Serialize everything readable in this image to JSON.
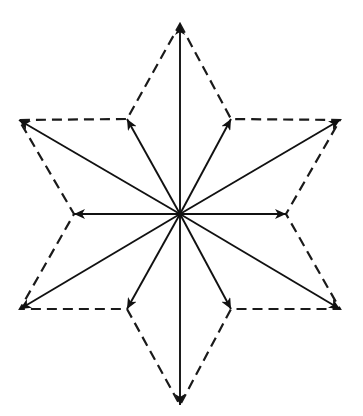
{
  "diagram": {
    "title": "",
    "type": "vector star diagram",
    "center": [
      180,
      214
    ],
    "colors": {
      "stroke": "#111111",
      "background": "#ffffff"
    },
    "outline_style": "dashed",
    "outer_vertices": [
      {
        "name": "top",
        "point": [
          180,
          24
        ]
      },
      {
        "name": "upper-right",
        "point": [
          340,
          120
        ]
      },
      {
        "name": "lower-right",
        "point": [
          340,
          309
        ]
      },
      {
        "name": "bottom",
        "point": [
          180,
          405
        ]
      },
      {
        "name": "lower-left",
        "point": [
          20,
          309
        ]
      },
      {
        "name": "upper-left",
        "point": [
          19,
          120
        ]
      }
    ],
    "inner_vertices": [
      {
        "name": "inner-upper-right",
        "point": [
          231,
          119
        ]
      },
      {
        "name": "inner-right",
        "point": [
          286,
          214
        ]
      },
      {
        "name": "inner-lower-right",
        "point": [
          231,
          309
        ]
      },
      {
        "name": "inner-lower-left",
        "point": [
          127,
          309
        ]
      },
      {
        "name": "inner-left",
        "point": [
          74,
          214
        ]
      },
      {
        "name": "inner-upper-left",
        "point": [
          127,
          119
        ]
      }
    ],
    "outline_order": [
      "top",
      "inner-upper-right",
      "upper-right",
      "inner-right",
      "lower-right",
      "inner-lower-right",
      "bottom",
      "inner-lower-left",
      "lower-left",
      "inner-left",
      "upper-left",
      "inner-upper-left"
    ],
    "arrows": [
      {
        "to": "top",
        "point": [
          180,
          24
        ]
      },
      {
        "to": "inner-upper-right",
        "point": [
          231,
          119
        ]
      },
      {
        "to": "upper-right",
        "point": [
          340,
          120
        ]
      },
      {
        "to": "inner-right",
        "point": [
          286,
          214
        ]
      },
      {
        "to": "lower-right",
        "point": [
          340,
          309
        ]
      },
      {
        "to": "inner-lower-right",
        "point": [
          231,
          309
        ]
      },
      {
        "to": "bottom",
        "point": [
          180,
          405
        ]
      },
      {
        "to": "inner-lower-left",
        "point": [
          127,
          309
        ]
      },
      {
        "to": "lower-left",
        "point": [
          20,
          309
        ]
      },
      {
        "to": "inner-left",
        "point": [
          74,
          214
        ]
      },
      {
        "to": "upper-left",
        "point": [
          19,
          120
        ]
      },
      {
        "to": "inner-upper-left",
        "point": [
          127,
          119
        ]
      }
    ]
  }
}
